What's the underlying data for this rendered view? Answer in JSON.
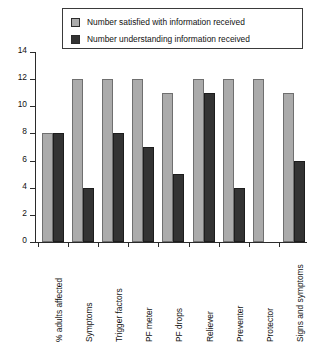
{
  "chart_data": {
    "type": "bar",
    "title": "",
    "xlabel": "",
    "ylabel": "Number of patients",
    "ylim": [
      0,
      14
    ],
    "yticks": [
      0,
      2,
      4,
      6,
      8,
      10,
      12,
      14
    ],
    "grid": false,
    "legend_position": "top",
    "categories": [
      "% adults affected",
      "Symptoms",
      "Trigger factors",
      "PF meter",
      "PF drops",
      "Reliever",
      "Preventer",
      "Protector",
      "Signs and symptoms"
    ],
    "series": [
      {
        "name": "Number satisfied with information received",
        "color": "#ababab",
        "values": [
          8,
          12,
          12,
          12,
          11,
          12,
          12,
          12,
          11
        ]
      },
      {
        "name": "Number understanding information received",
        "color": "#333333",
        "values": [
          8,
          4,
          8,
          7,
          5,
          11,
          4,
          0,
          6
        ]
      }
    ]
  },
  "legend": {
    "items": [
      {
        "label": "Number satisfied with information received"
      },
      {
        "label": "Number understanding information received"
      }
    ]
  }
}
